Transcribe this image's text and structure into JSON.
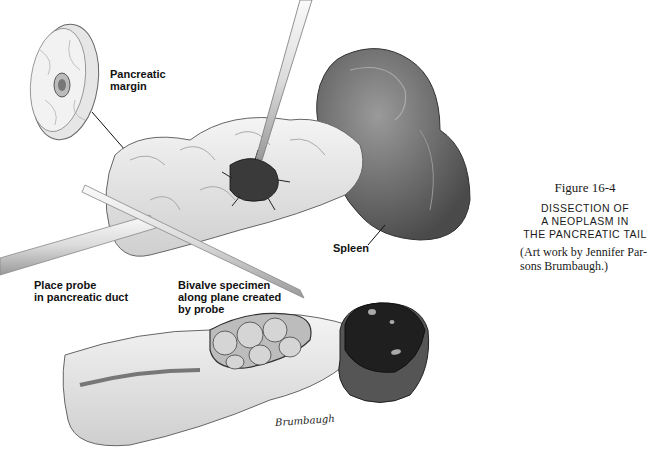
{
  "figure": {
    "number": "Figure 16-4",
    "title_lines": [
      "DISSECTION OF",
      "A NEOPLASM IN",
      "THE PANCREATIC TAIL"
    ],
    "credit_lines": [
      "(Art work by Jennifer Par-",
      "sons Brumbaugh.)"
    ]
  },
  "labels": {
    "pancreatic_margin": [
      "Pancreatic",
      "margin"
    ],
    "spleen": "Spleen",
    "probe": [
      "Place probe",
      "in pancreatic duct"
    ],
    "bivalve": [
      "Bivalve specimen",
      "along plane created",
      "by probe"
    ]
  },
  "signature": "Brumbaugh",
  "colors": {
    "tissue": "#e8e8e8",
    "outline": "#555555",
    "spleen": "#6e6e6e",
    "spleen_cut": "#2a2a2a",
    "ink": "#111111"
  }
}
